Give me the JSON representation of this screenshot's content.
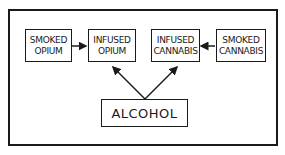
{
  "diagram": {
    "nodes": [
      {
        "id": "smoked-opium",
        "lines": [
          "SMOKED",
          "OPIUM"
        ]
      },
      {
        "id": "infused-opium",
        "lines": [
          "INFUSED",
          "OPIUM"
        ]
      },
      {
        "id": "infused-cannabis",
        "lines": [
          "INFUSED",
          "CANNABIS"
        ]
      },
      {
        "id": "smoked-cannabis",
        "lines": [
          "SMOKED",
          "CANNABIS"
        ]
      },
      {
        "id": "alcohol",
        "lines": [
          "ALCOHOL"
        ]
      }
    ],
    "edges": [
      {
        "from": "smoked-opium",
        "to": "infused-opium"
      },
      {
        "from": "smoked-cannabis",
        "to": "infused-cannabis"
      },
      {
        "from": "alcohol",
        "to": "infused-opium"
      },
      {
        "from": "alcohol",
        "to": "infused-cannabis"
      }
    ],
    "colors": {
      "stroke": "#1a1a1a",
      "background": "#ffffff"
    }
  }
}
